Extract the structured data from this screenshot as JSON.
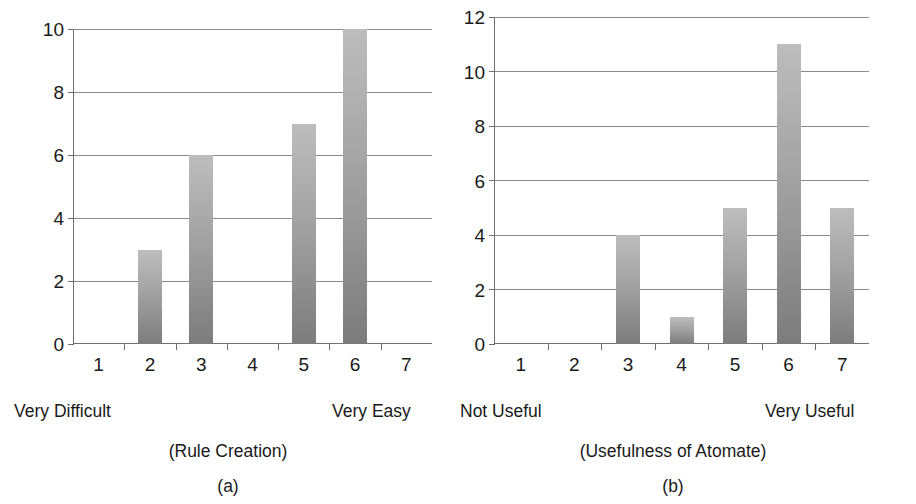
{
  "figure": {
    "background": "#ffffff",
    "bar_color_top": "#bdbdbd",
    "bar_color_bottom": "#7c7c7c",
    "axis_color": "#6f6f6f",
    "gridline_color": "#8a8a8a",
    "text_color": "#1a1a1a"
  },
  "chart_data": [
    {
      "type": "bar",
      "panel": "a",
      "title": "",
      "subtitle": "(Rule Creation)",
      "panel_index": "(a)",
      "categories": [
        "1",
        "2",
        "3",
        "4",
        "5",
        "6",
        "7"
      ],
      "values": [
        0,
        3,
        6,
        0,
        7,
        10,
        0
      ],
      "xlabel": "(Rule Creation)",
      "ylabel": "",
      "ylim": [
        0,
        10
      ],
      "yticks": [
        0,
        2,
        4,
        6,
        8,
        10
      ],
      "ytick_labels": [
        "0",
        "2",
        "4",
        "6",
        "8",
        "10"
      ],
      "scale_left_label": "Very Difficult",
      "scale_right_label": "Very Easy",
      "grid": true,
      "legend": null
    },
    {
      "type": "bar",
      "panel": "b",
      "title": "",
      "subtitle": "(Usefulness of Atomate)",
      "panel_index": "(b)",
      "categories": [
        "1",
        "2",
        "3",
        "4",
        "5",
        "6",
        "7"
      ],
      "values": [
        0,
        0,
        4,
        1,
        5,
        11,
        5
      ],
      "xlabel": "(Usefulness of Atomate)",
      "ylabel": "",
      "ylim": [
        0,
        12
      ],
      "yticks": [
        0,
        2,
        4,
        6,
        8,
        10,
        12
      ],
      "ytick_labels": [
        "0",
        "2",
        "4",
        "6",
        "8",
        "10",
        "12"
      ],
      "scale_left_label": "Not Useful",
      "scale_right_label": "Very Useful",
      "grid": true,
      "legend": null
    }
  ],
  "panel_a": {
    "ytick_labels": [
      "0",
      "2",
      "4",
      "6",
      "8",
      "10"
    ],
    "xtick_labels": [
      "1",
      "2",
      "3",
      "4",
      "5",
      "6",
      "7"
    ],
    "scale_left": "Very Difficult",
    "scale_right": "Very Easy",
    "subtitle": "(Rule Creation)",
    "index": "(a)"
  },
  "panel_b": {
    "ytick_labels": [
      "0",
      "2",
      "4",
      "6",
      "8",
      "10",
      "12"
    ],
    "xtick_labels": [
      "1",
      "2",
      "3",
      "4",
      "5",
      "6",
      "7"
    ],
    "scale_left": "Not Useful",
    "scale_right": "Very Useful",
    "subtitle": "(Usefulness of Atomate)",
    "index": "(b)"
  }
}
